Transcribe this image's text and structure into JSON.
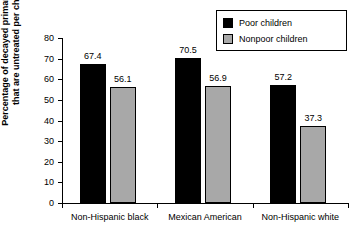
{
  "chart_data": {
    "type": "bar",
    "title": "",
    "xlabel": "",
    "ylabel": "Percentage of decayed primary teeth that are untreated per child",
    "ylabel_line1": "Percentage of decayed primary teeth",
    "ylabel_line2": "that are untreated per child",
    "categories": [
      "Non-Hispanic black",
      "Mexican American",
      "Non-Hispanic white"
    ],
    "series": [
      {
        "name": "Poor children",
        "color": "#000000",
        "values": [
          67.4,
          70.5,
          57.2
        ]
      },
      {
        "name": "Nonpoor children",
        "color": "#a8a8a8",
        "values": [
          56.1,
          56.9,
          37.3
        ]
      }
    ],
    "ylim": [
      0,
      80
    ],
    "yticks": [
      0,
      10,
      20,
      30,
      40,
      50,
      60,
      70,
      80
    ],
    "ytick_labels": [
      "0",
      "10",
      "20",
      "30",
      "40",
      "50",
      "60",
      "70",
      "80"
    ],
    "grid": false,
    "legend_position": "top-right",
    "value_labels": [
      "67.4",
      "56.1",
      "70.5",
      "56.9",
      "57.2",
      "37.3"
    ],
    "background_color": "#ffffff",
    "axis_color": "#000000"
  },
  "legend": {
    "items": [
      {
        "label": "Poor children",
        "swatch": "black-square-swatch"
      },
      {
        "label": "Nonpoor children",
        "swatch": "gray-square-swatch"
      }
    ]
  }
}
